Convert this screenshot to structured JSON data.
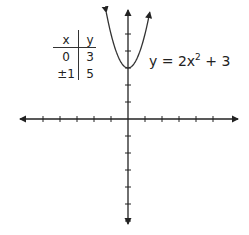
{
  "chart_data": {
    "type": "line",
    "title": "",
    "xlabel": "",
    "ylabel": "",
    "function": "y = 2x^2 + 3",
    "equation_label": {
      "lhs": "y = 2x",
      "exp": "2",
      "rhs": " + 3"
    },
    "xlim": [
      -6.3,
      6.3
    ],
    "ylim": [
      -6.1,
      6.3
    ],
    "x_ticks": [
      -5,
      -4,
      -3,
      -2,
      -1,
      1,
      2,
      3,
      4,
      5
    ],
    "y_ticks": [
      -6,
      -5,
      -4,
      -3,
      -2,
      -1,
      1,
      2,
      3,
      4,
      5
    ],
    "tick_labels_shown": false,
    "grid": false,
    "series": [
      {
        "name": "y = 2x^2 + 3",
        "x": [
          -1.28,
          -1,
          -0.5,
          0,
          0.5,
          1,
          1.28
        ],
        "y": [
          6.28,
          5,
          3.5,
          3,
          3.5,
          5,
          6.28
        ]
      }
    ],
    "table": {
      "headers": [
        "x",
        "y"
      ],
      "rows": [
        [
          "0",
          "3"
        ],
        [
          "±1",
          "5"
        ]
      ]
    }
  }
}
